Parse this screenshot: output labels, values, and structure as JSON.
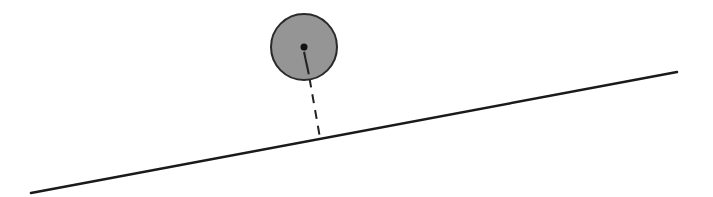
{
  "diagram": {
    "type": "physics-sketch",
    "incline": {
      "x1": 31,
      "y1": 193,
      "x2": 677,
      "y2": 72,
      "color": "#1a1a1a",
      "width": 2.5
    },
    "ball": {
      "cx": 304,
      "cy": 47,
      "r": 33,
      "fill": "#8a8a8a",
      "stroke": "#2a2a2a"
    },
    "center_dot": {
      "r": 3.5,
      "color": "#111111"
    },
    "perpendicular": {
      "x1": 304,
      "y1": 47,
      "x2": 320,
      "y2": 138,
      "dash": "9,7",
      "color": "#222222"
    }
  }
}
